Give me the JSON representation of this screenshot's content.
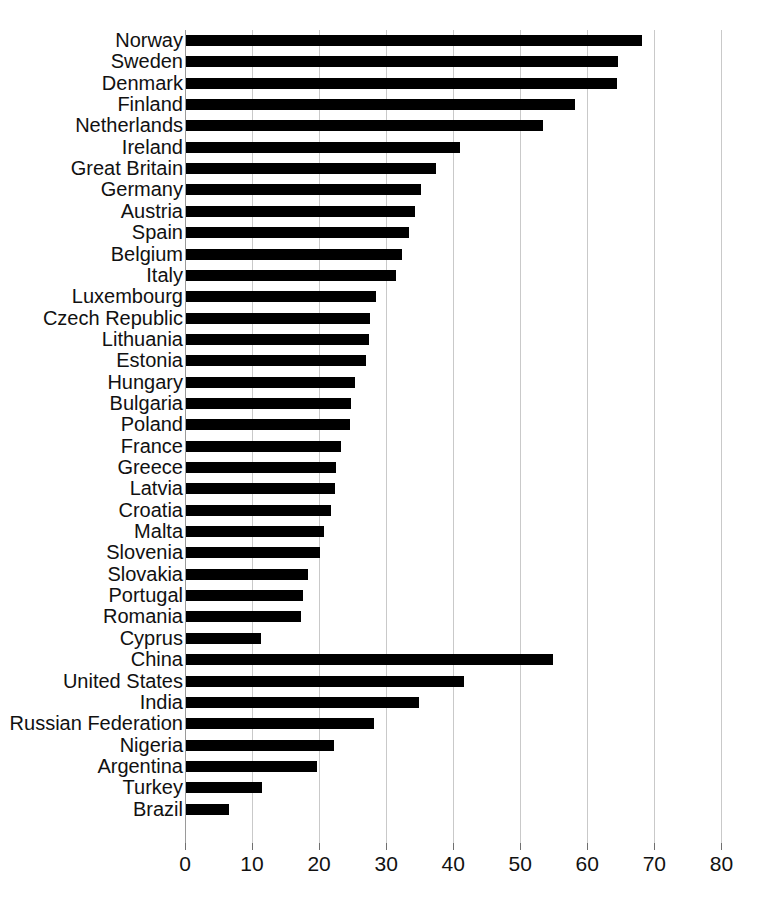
{
  "chart_data": {
    "type": "bar",
    "orientation": "horizontal",
    "title": "",
    "subtitle": "",
    "xlabel": "",
    "ylabel": "",
    "xlim": [
      0,
      80
    ],
    "ylim": null,
    "grid": true,
    "legend": false,
    "legend_position": "none",
    "bar_color": "#000000",
    "gridline_color": "#c9c9c9",
    "background_color": "#ffffff",
    "xticks": [
      0,
      10,
      20,
      30,
      40,
      50,
      60,
      70,
      80
    ],
    "xtick_labels": [
      "0",
      "10",
      "20",
      "30",
      "40",
      "50",
      "60",
      "70",
      "80"
    ],
    "categories": [
      "Norway",
      "Sweden",
      "Denmark",
      "Finland",
      "Netherlands",
      "Ireland",
      "Great Britain",
      "Germany",
      "Austria",
      "Spain",
      "Belgium",
      "Italy",
      "Luxembourg",
      "Czech Republic",
      "Lithuania",
      "Estonia",
      "Hungary",
      "Bulgaria",
      "Poland",
      "France",
      "Greece",
      "Latvia",
      "Croatia",
      "Malta",
      "Slovenia",
      "Slovakia",
      "Portugal",
      "Romania",
      "Cyprus",
      "China",
      "United States",
      "India",
      "Russian Federation",
      "Nigeria",
      "Argentina",
      "Turkey",
      "Brazil"
    ],
    "values": [
      68.0,
      64.5,
      64.3,
      58.0,
      53.2,
      40.8,
      37.3,
      35.0,
      34.2,
      33.2,
      32.2,
      31.3,
      28.4,
      27.5,
      27.3,
      26.8,
      25.2,
      24.6,
      24.4,
      23.1,
      22.4,
      22.2,
      21.6,
      20.6,
      20.0,
      18.2,
      17.5,
      17.2,
      11.2,
      54.8,
      41.4,
      34.7,
      28.0,
      22.0,
      19.6,
      11.4,
      6.4
    ]
  }
}
